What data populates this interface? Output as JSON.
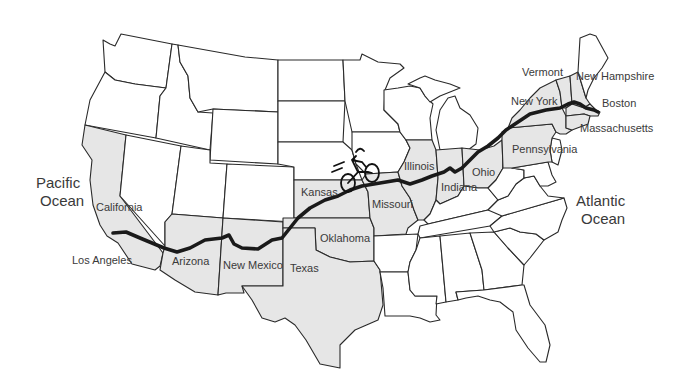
{
  "map": {
    "title": "Cross-country bicycle route: Los Angeles to Boston",
    "colors": {
      "highlighted_state": "#e6e6e6",
      "plain_state": "#ffffff",
      "border": "#2a2a2a",
      "route": "#1a1a1a",
      "label": "#3a3a3a"
    },
    "oceans": {
      "pacific_line1": "Pacific",
      "pacific_line2": "Ocean",
      "atlantic_line1": "Atlantic",
      "atlantic_line2": "Ocean"
    },
    "cities": {
      "start": "Los Angeles",
      "end": "Boston"
    },
    "route_states": [
      "California",
      "Arizona",
      "New Mexico",
      "Texas",
      "Oklahoma",
      "Kansas",
      "Missouri",
      "Illinois",
      "Indiana",
      "Ohio",
      "Pennsylvania",
      "New York",
      "Vermont",
      "New Hampshire",
      "Massachusetts"
    ],
    "labels": {
      "california": "California",
      "arizona": "Arizona",
      "new_mexico": "New Mexico",
      "texas": "Texas",
      "oklahoma": "Oklahoma",
      "kansas": "Kansas",
      "missouri": "Missouri",
      "illinois": "Illinois",
      "indiana": "Indiana",
      "ohio": "Ohio",
      "pennsylvania": "Pennsylvania",
      "new_york": "New York",
      "vermont": "Vermont",
      "new_hampshire": "New Hampshire",
      "massachusetts": "Massachusetts"
    },
    "icon": "bicycle-icon"
  }
}
